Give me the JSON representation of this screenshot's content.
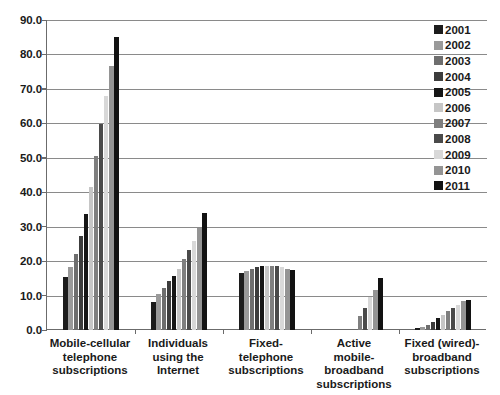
{
  "chart_data": {
    "type": "bar",
    "title": "",
    "subtitle": "",
    "xlabel": "",
    "ylabel": "",
    "ylim": [
      0.0,
      90.0
    ],
    "ytick_step": 10.0,
    "ytick_labels": [
      "90.0",
      "80.0",
      "70.0",
      "60.0",
      "50.0",
      "40.0",
      "30.0",
      "20.0",
      "10.0",
      "0.0"
    ],
    "ytick_values": [
      90.0,
      80.0,
      70.0,
      60.0,
      50.0,
      40.0,
      30.0,
      20.0,
      10.0,
      0.0
    ],
    "grid": true,
    "grid_axis": "y",
    "legend_position": "right",
    "categories": [
      "Mobile-cellular telephone subscriptions",
      "Individuals using the Internet",
      "Fixed-telephone subscriptions",
      "Active mobile-broadband subscriptions",
      "Fixed (wired)-broadband subscriptions"
    ],
    "category_lines": [
      [
        "Mobile-cellular",
        "telephone",
        "subscriptions"
      ],
      [
        "Individuals",
        "using the Internet"
      ],
      [
        "Fixed-telephone",
        "subscriptions"
      ],
      [
        "Active",
        "mobile-broadband",
        "subscriptions"
      ],
      [
        "Fixed (wired)-",
        "broadband",
        "subscriptions"
      ]
    ],
    "series": [
      {
        "name": "2001",
        "color": "#1c1c1c",
        "values": [
          15.5,
          8.0,
          16.6,
          0.0,
          0.6
        ]
      },
      {
        "name": "2002",
        "color": "#9a9a9a",
        "values": [
          18.4,
          10.6,
          17.2,
          0.0,
          1.0
        ]
      },
      {
        "name": "2003",
        "color": "#6e6e6e",
        "values": [
          22.1,
          12.3,
          17.8,
          0.0,
          1.5
        ]
      },
      {
        "name": "2004",
        "color": "#3c3c3c",
        "values": [
          27.2,
          14.1,
          18.3,
          0.0,
          2.3
        ]
      },
      {
        "name": "2005",
        "color": "#161616",
        "values": [
          33.6,
          15.8,
          18.7,
          0.0,
          3.4
        ]
      },
      {
        "name": "2006",
        "color": "#c6c6c6",
        "values": [
          41.6,
          17.6,
          18.6,
          0.0,
          4.4
        ]
      },
      {
        "name": "2007",
        "color": "#7f7f7f",
        "values": [
          50.6,
          20.6,
          18.5,
          4.0,
          5.4
        ]
      },
      {
        "name": "2008",
        "color": "#4a4a4a",
        "values": [
          59.9,
          23.3,
          18.5,
          6.3,
          6.4
        ]
      },
      {
        "name": "2009",
        "color": "#d8d8d8",
        "values": [
          68.0,
          25.8,
          18.2,
          9.5,
          7.4
        ]
      },
      {
        "name": "2010",
        "color": "#949494",
        "values": [
          76.6,
          29.5,
          17.8,
          11.7,
          8.3
        ]
      },
      {
        "name": "2011",
        "color": "#121212",
        "values": [
          85.0,
          34.0,
          17.5,
          15.0,
          8.8
        ]
      }
    ]
  }
}
